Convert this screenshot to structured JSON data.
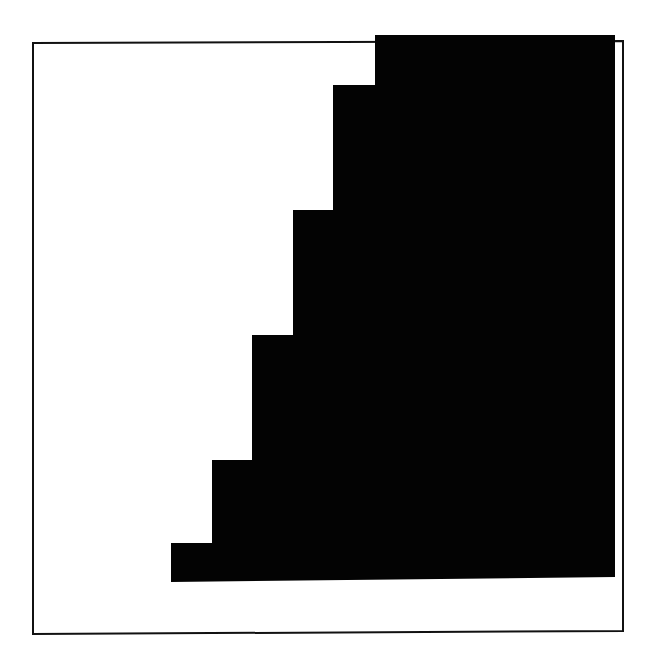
{
  "figure": {
    "background_color": "#ffffff",
    "frame": {
      "x1": 33,
      "y1": 43,
      "x2": 623,
      "y2": 634,
      "stroke": "#111111",
      "stroke_width": 2
    },
    "staircase": {
      "fill": "#030303",
      "points": [
        [
          375,
          35
        ],
        [
          375,
          85
        ],
        [
          333,
          85
        ],
        [
          333,
          210
        ],
        [
          293,
          210
        ],
        [
          293,
          335
        ],
        [
          252,
          335
        ],
        [
          252,
          460
        ],
        [
          212,
          460
        ],
        [
          212,
          543
        ],
        [
          171,
          543
        ],
        [
          171,
          582
        ],
        [
          615,
          577
        ],
        [
          615,
          35
        ]
      ],
      "step_count": 5
    }
  }
}
